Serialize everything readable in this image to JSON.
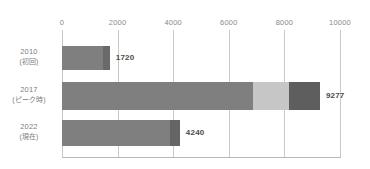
{
  "chart_data": {
    "type": "bar",
    "orientation": "horizontal",
    "title": "",
    "subtitle": "",
    "xlabel": "",
    "ylabel": "",
    "xlim": [
      0,
      10000
    ],
    "xticks": [
      0,
      2000,
      4000,
      6000,
      8000,
      10000
    ],
    "xtick_labels": [
      "0",
      "2000",
      "4000",
      "6000",
      "8000",
      "10000"
    ],
    "grid": true,
    "grid_axis": "x",
    "legend": false,
    "legend_position": "none",
    "categories": [
      "2010\n(初回)",
      "2017\n(ピーク時)",
      "2022\n(現在)"
    ],
    "values": [
      1720,
      9277,
      4240
    ],
    "data_labels": [
      "1720",
      "9277",
      "4240"
    ],
    "bars": [
      {
        "year": "2010",
        "sub": "(初回)",
        "total": 1720,
        "label": "1720",
        "segments": [
          {
            "name": "main",
            "start": 0,
            "end": 1480,
            "color": "#7f7f7f"
          },
          {
            "name": "cap",
            "start": 1480,
            "end": 1720,
            "color": "#6a6a6a"
          }
        ]
      },
      {
        "year": "2017",
        "sub": "(ピーク時)",
        "total": 9277,
        "label": "9277",
        "segments": [
          {
            "name": "main",
            "start": 0,
            "end": 6870,
            "color": "#7f7f7f"
          },
          {
            "name": "light",
            "start": 6870,
            "end": 8160,
            "color": "#c6c6c6"
          },
          {
            "name": "cap",
            "start": 8160,
            "end": 9277,
            "color": "#5e5e5e"
          }
        ]
      },
      {
        "year": "2022",
        "sub": "(現在)",
        "total": 4240,
        "label": "4240",
        "segments": [
          {
            "name": "main",
            "start": 0,
            "end": 3890,
            "color": "#7f7f7f"
          },
          {
            "name": "cap",
            "start": 3890,
            "end": 4240,
            "color": "#656565"
          }
        ]
      }
    ],
    "colors": {
      "bar_main": "#7f7f7f",
      "bar_light": "#c6c6c6",
      "bar_cap": "#5e5e5e",
      "gridline": "#c9c9c9",
      "axis": "#b8b8b8",
      "tick_text": "#8a8a8a",
      "category_text": "#7d7d7d",
      "value_text": "#4a4a4a",
      "background": "#ffffff"
    }
  }
}
